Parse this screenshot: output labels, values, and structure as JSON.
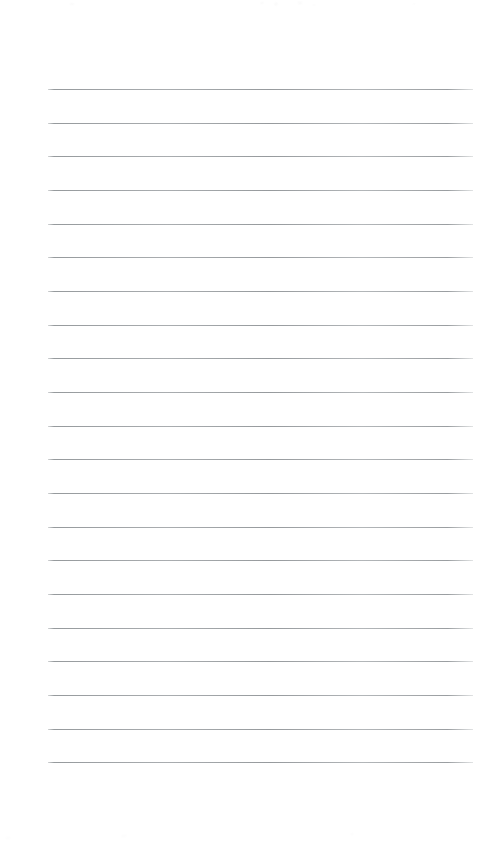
{
  "document": {
    "type": "ruled-paper",
    "title": "Blank ruled notebook page",
    "content_text": "",
    "page_width": 492,
    "page_height": 846,
    "background_color": "#ffffff"
  },
  "ruling": {
    "line_count": 21,
    "first_line_y": 89,
    "line_spacing": 33.65,
    "line_start_x": 48,
    "line_end_x": 473,
    "line_length": 425,
    "line_thickness": 1,
    "line_color": "#b0b4b6",
    "left_margin": 48,
    "right_margin": 19,
    "top_margin": 89,
    "bottom_margin": 84,
    "margin_rule": false,
    "header_text": "",
    "footer_text": ""
  },
  "lines": [
    {
      "index": 1,
      "y": 89,
      "text": ""
    },
    {
      "index": 2,
      "y": 123,
      "text": ""
    },
    {
      "index": 3,
      "y": 156,
      "text": ""
    },
    {
      "index": 4,
      "y": 190,
      "text": ""
    },
    {
      "index": 5,
      "y": 224,
      "text": ""
    },
    {
      "index": 6,
      "y": 257,
      "text": ""
    },
    {
      "index": 7,
      "y": 291,
      "text": ""
    },
    {
      "index": 8,
      "y": 325,
      "text": ""
    },
    {
      "index": 9,
      "y": 358,
      "text": ""
    },
    {
      "index": 10,
      "y": 392,
      "text": ""
    },
    {
      "index": 11,
      "y": 426,
      "text": ""
    },
    {
      "index": 12,
      "y": 459,
      "text": ""
    },
    {
      "index": 13,
      "y": 493,
      "text": ""
    },
    {
      "index": 14,
      "y": 527,
      "text": ""
    },
    {
      "index": 15,
      "y": 560,
      "text": ""
    },
    {
      "index": 16,
      "y": 594,
      "text": ""
    },
    {
      "index": 17,
      "y": 628,
      "text": ""
    },
    {
      "index": 18,
      "y": 661,
      "text": ""
    },
    {
      "index": 19,
      "y": 695,
      "text": ""
    },
    {
      "index": 20,
      "y": 729,
      "text": ""
    },
    {
      "index": 21,
      "y": 762,
      "text": ""
    }
  ]
}
